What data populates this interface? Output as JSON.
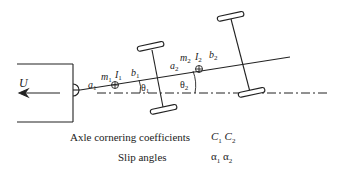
{
  "diagram": {
    "type": "vehicle-trailer-model",
    "velocity_label": "U",
    "unit1": {
      "front_len": "a",
      "front_sub": "1",
      "mass": "m",
      "mass_sub": "1",
      "inertia": "I",
      "inertia_sub": "1",
      "rear_len": "b",
      "rear_sub": "1",
      "angle": "θ",
      "angle_sub": "1"
    },
    "unit2": {
      "front_len": "a",
      "front_sub": "2",
      "mass": "m",
      "mass_sub": "2",
      "inertia": "I",
      "inertia_sub": "2",
      "rear_len": "b",
      "rear_sub": "2",
      "angle": "θ",
      "angle_sub": "2"
    }
  },
  "legend": [
    {
      "name": "Axle cornering coefficients",
      "symbol": "C",
      "subs": [
        "1",
        "2"
      ]
    },
    {
      "name": "Slip angles",
      "symbol": "α",
      "subs": [
        "1",
        "2"
      ]
    }
  ],
  "colors": {
    "line": "#222222",
    "background": "#ffffff"
  }
}
